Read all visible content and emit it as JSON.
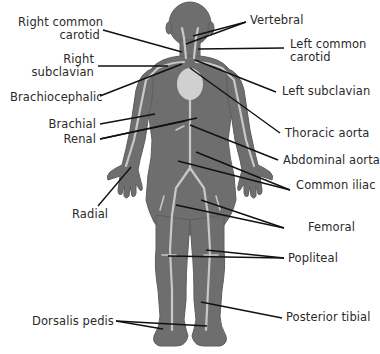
{
  "diagram": {
    "colors": {
      "body": "#6e6e6e",
      "body_edge": "#5a5a5a",
      "artery": "#c8c8c8",
      "heart": "#d0d0d0",
      "leader": "#111111",
      "text": "#2a2a2a"
    },
    "labels": {
      "right_common_carotid_1": "Right common",
      "right_common_carotid_2": "carotid",
      "right_subclavian_1": "Right",
      "right_subclavian_2": "subclavian",
      "brachiocephalic": "Brachiocephalic",
      "brachial": "Brachial",
      "renal": "Renal",
      "radial": "Radial",
      "dorsalis_pedis": "Dorsalis pedis",
      "vertebral": "Vertebral",
      "left_common_carotid_1": "Left common",
      "left_common_carotid_2": "carotid",
      "left_subclavian": "Left subclavian",
      "thoracic_aorta": "Thoracic aorta",
      "abdominal_aorta": "Abdominal aorta",
      "common_iliac": "Common iliac",
      "femoral": "Femoral",
      "popliteal": "Popliteal",
      "posterior_tibial": "Posterior tibial"
    }
  }
}
